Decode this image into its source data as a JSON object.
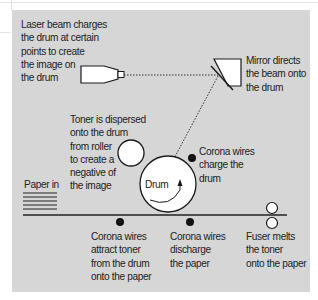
{
  "diagram": {
    "labels": {
      "laser": "Laser beam charges\nthe drum at certain\npoints to create\nthe image on\nthe drum",
      "mirror": "Mirror directs\nthe beam onto\nthe drum",
      "toner": "Toner is dispersed\nonto the drum\nfrom roller\nto create a\nnegative of\nthe image",
      "corona_charge": "Corona wires\ncharge the\ndrum",
      "drum": "Drum",
      "paper_in": "Paper in",
      "corona_attract": "Corona wires\nattract toner\nfrom the drum\nonto the paper",
      "corona_discharge": "Corona wires\ndischarge\nthe paper",
      "fuser": "Fuser melts\nthe toner\nonto the paper"
    },
    "colors": {
      "panel": "#d6d6d6",
      "stroke": "#1a1a1a",
      "fill": "#ffffff"
    }
  }
}
